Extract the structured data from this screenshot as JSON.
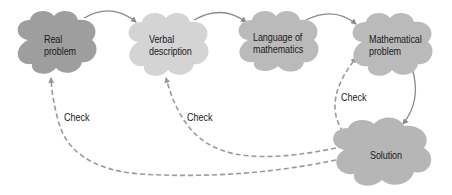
{
  "diagram": {
    "type": "flow",
    "nodes": [
      {
        "id": "real",
        "label_lines": [
          "Real",
          "problem"
        ],
        "color": "#9e9e9e"
      },
      {
        "id": "verbal",
        "label_lines": [
          "Verbal",
          "description"
        ],
        "color": "#d4d4d4"
      },
      {
        "id": "language",
        "label_lines": [
          "Language of",
          "mathematics"
        ],
        "color": "#bababa"
      },
      {
        "id": "math",
        "label_lines": [
          "Mathematical",
          "problem"
        ],
        "color": "#bababa"
      },
      {
        "id": "solution",
        "label_lines": [
          "Solution"
        ],
        "color": "#b6b6b6"
      }
    ],
    "edges": [
      {
        "from": "real",
        "to": "verbal",
        "style": "solid"
      },
      {
        "from": "verbal",
        "to": "language",
        "style": "solid"
      },
      {
        "from": "language",
        "to": "math",
        "style": "solid"
      },
      {
        "from": "math",
        "to": "solution",
        "style": "solid"
      },
      {
        "from": "solution",
        "to": "math",
        "style": "dashed",
        "label": "Check"
      },
      {
        "from": "solution",
        "to": "verbal",
        "style": "dashed",
        "label": "Check"
      },
      {
        "from": "solution",
        "to": "real",
        "style": "dashed",
        "label": "Check"
      }
    ],
    "check_label": "Check"
  },
  "labels": {
    "real_1": "Real",
    "real_2": "problem",
    "verbal_1": "Verbal",
    "verbal_2": "description",
    "language_1": "Language of",
    "language_2": "mathematics",
    "math_1": "Mathematical",
    "math_2": "problem",
    "solution": "Solution",
    "check_real": "Check",
    "check_verbal": "Check",
    "check_math": "Check"
  },
  "colors": {
    "arrow": "#8a8a8a",
    "dashed": "#9a9a9a"
  }
}
